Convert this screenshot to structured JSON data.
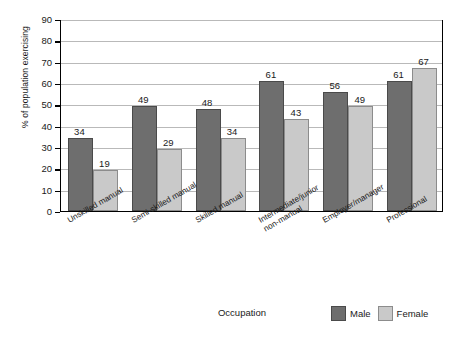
{
  "chart_data": {
    "type": "bar",
    "title": "",
    "xlabel": "Occupation",
    "ylabel": "% of population exercising",
    "ylim": [
      0,
      90
    ],
    "ytick_step": 10,
    "yticks": [
      0,
      10,
      20,
      30,
      40,
      50,
      60,
      70,
      80,
      90
    ],
    "grid": true,
    "legend_position": "bottom-right",
    "categories": [
      "Unskilled manual",
      "Semi-skilled manual",
      "Skilled manual",
      "Intermediate/junior non-manual",
      "Employer/manager",
      "Professional"
    ],
    "category_lines": [
      [
        "Unskilled manual"
      ],
      [
        "Semi-skilled manual"
      ],
      [
        "Skilled manual"
      ],
      [
        "Intermediate/junior",
        "non-manual"
      ],
      [
        "Employer/manager"
      ],
      [
        "Professional"
      ]
    ],
    "series": [
      {
        "name": "Male",
        "color": "#6e6e6e",
        "values": [
          34,
          49,
          48,
          61,
          56,
          61
        ]
      },
      {
        "name": "Female",
        "color": "#c9c9c9",
        "values": [
          19,
          29,
          34,
          43,
          49,
          67
        ]
      }
    ]
  },
  "axis": {
    "y_title": "% of population exercising",
    "x_title": "Occupation",
    "y_tick_labels": [
      "90",
      "80",
      "70",
      "60",
      "50",
      "40",
      "30",
      "20",
      "10",
      "0"
    ]
  },
  "legend": {
    "entries": [
      {
        "label": "Male",
        "swatch": "male"
      },
      {
        "label": "Female",
        "swatch": "female"
      }
    ]
  },
  "values": {
    "male": {
      "v0": "34",
      "v1": "49",
      "v2": "48",
      "v3": "61",
      "v4": "56",
      "v5": "61"
    },
    "female": {
      "v0": "19",
      "v1": "29",
      "v2": "34",
      "v3": "43",
      "v4": "49",
      "v5": "67"
    }
  }
}
